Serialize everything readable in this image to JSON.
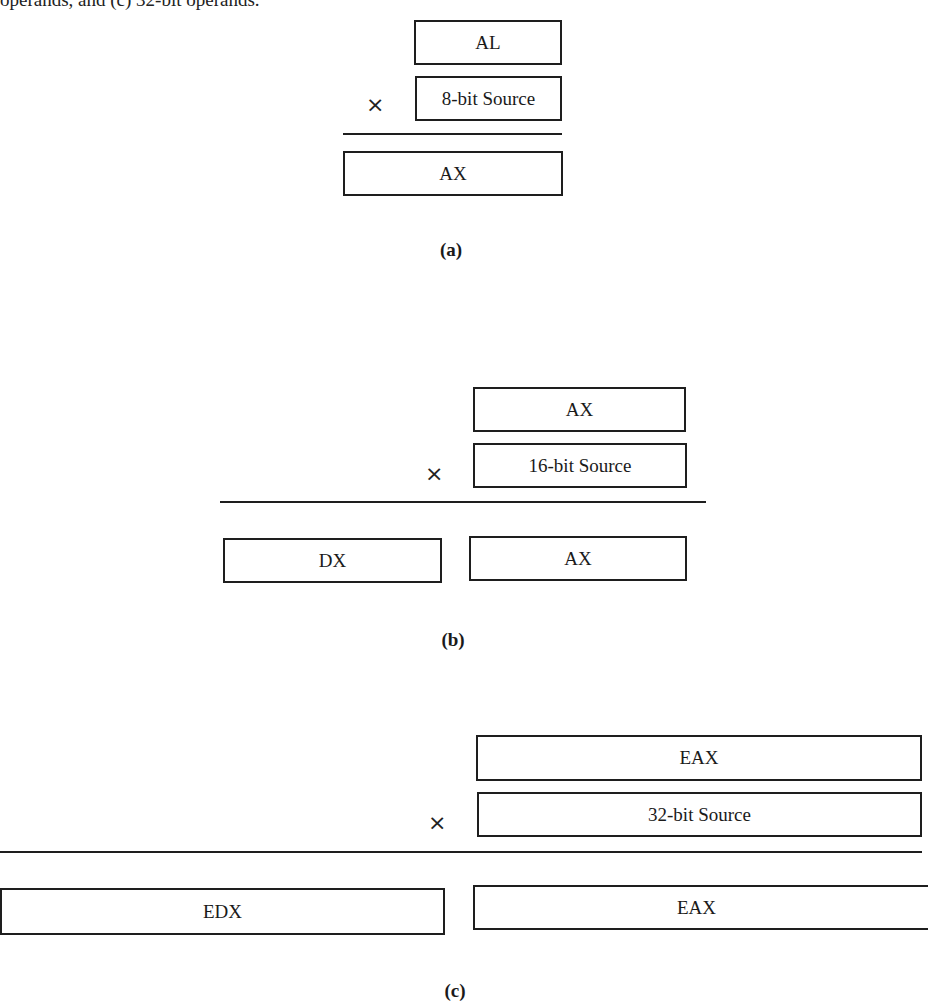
{
  "caption_fragment": "operands, and (c) 32-bit operands.",
  "figures": {
    "a": {
      "label": "(a)",
      "operand1": "AL",
      "operand2": "8-bit Source",
      "operator": "×",
      "result": [
        "AX"
      ]
    },
    "b": {
      "label": "(b)",
      "operand1": "AX",
      "operand2": "16-bit Source",
      "operator": "×",
      "result": [
        "DX",
        "AX"
      ]
    },
    "c": {
      "label": "(c)",
      "operand1": "EAX",
      "operand2": "32-bit Source",
      "operator": "×",
      "result": [
        "EDX",
        "EAX"
      ]
    }
  }
}
